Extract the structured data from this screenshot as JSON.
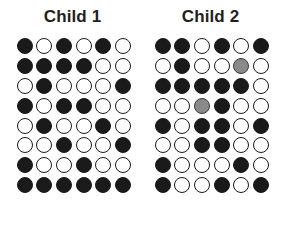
{
  "figure": {
    "title": "",
    "legend_states": [
      "filled",
      "open",
      "gray"
    ],
    "colors": {
      "filled": "#1a1a1a",
      "open": "#ffffff",
      "open_outline": "#1a1a1a",
      "gray": "#8a8a8a",
      "gray_outline": "#3a3a3a",
      "title_text": "#231f20",
      "background": "#ffffff"
    }
  },
  "panels": [
    {
      "id": "child-1",
      "title": "Child 1",
      "rows": 8,
      "columns": 6,
      "grid": [
        [
          "filled",
          "open",
          "filled",
          "open",
          "filled",
          "open"
        ],
        [
          "filled",
          "filled",
          "filled",
          "filled",
          "open",
          "open"
        ],
        [
          "open",
          "filled",
          "open",
          "open",
          "open",
          "filled"
        ],
        [
          "filled",
          "open",
          "filled",
          "filled",
          "open",
          "open"
        ],
        [
          "open",
          "filled",
          "open",
          "open",
          "filled",
          "open"
        ],
        [
          "open",
          "open",
          "filled",
          "open",
          "open",
          "filled"
        ],
        [
          "filled",
          "open",
          "open",
          "filled",
          "open",
          "open"
        ],
        [
          "filled",
          "filled",
          "filled",
          "filled",
          "filled",
          "filled"
        ]
      ]
    },
    {
      "id": "child-2",
      "title": "Child 2",
      "rows": 8,
      "columns": 6,
      "grid": [
        [
          "filled",
          "filled",
          "open",
          "filled",
          "open",
          "filled"
        ],
        [
          "open",
          "filled",
          "open",
          "open",
          "gray",
          "open"
        ],
        [
          "filled",
          "filled",
          "filled",
          "filled",
          "filled",
          "open"
        ],
        [
          "open",
          "open",
          "gray",
          "filled",
          "open",
          "open"
        ],
        [
          "filled",
          "open",
          "filled",
          "filled",
          "open",
          "filled"
        ],
        [
          "open",
          "open",
          "filled",
          "filled",
          "open",
          "open"
        ],
        [
          "filled",
          "open",
          "open",
          "open",
          "filled",
          "open"
        ],
        [
          "filled",
          "open",
          "open",
          "filled",
          "open",
          "filled"
        ]
      ]
    }
  ]
}
